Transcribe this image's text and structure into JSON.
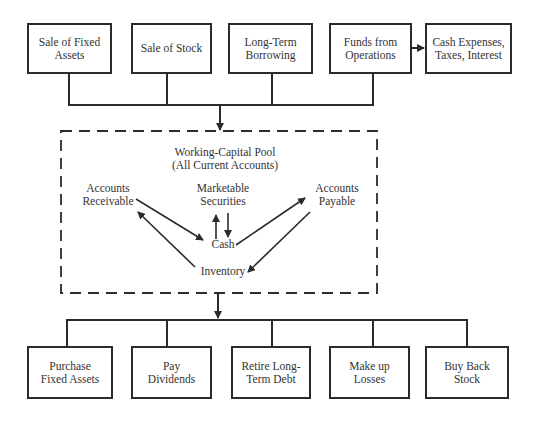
{
  "diagram": {
    "sources": [
      {
        "id": "sale-fixed-assets",
        "label": "Sale of Fixed\nAssets"
      },
      {
        "id": "sale-stock",
        "label": "Sale of Stock"
      },
      {
        "id": "long-term-borrowing",
        "label": "Long-Term\nBorrowing"
      },
      {
        "id": "funds-from-operations",
        "label": "Funds from\nOperations"
      }
    ],
    "expense_box": {
      "id": "cash-expenses",
      "label": "Cash Expenses,\nTaxes, Interest"
    },
    "pool": {
      "title": "Working-Capital Pool\n(All Current Accounts)",
      "nodes": [
        {
          "id": "accounts-receivable",
          "label": "Accounts\nReceivable"
        },
        {
          "id": "marketable-securities",
          "label": "Marketable\nSecurities"
        },
        {
          "id": "accounts-payable",
          "label": "Accounts\nPayable"
        },
        {
          "id": "cash",
          "label": "Cash"
        },
        {
          "id": "inventory",
          "label": "Inventory"
        }
      ],
      "flows": [
        {
          "from": "accounts-receivable",
          "to": "cash"
        },
        {
          "from": "inventory",
          "to": "accounts-receivable"
        },
        {
          "from": "cash",
          "to": "marketable-securities"
        },
        {
          "from": "marketable-securities",
          "to": "cash"
        },
        {
          "from": "cash",
          "to": "accounts-payable"
        },
        {
          "from": "accounts-payable",
          "to": "inventory"
        }
      ]
    },
    "uses": [
      {
        "id": "purchase-fixed-assets",
        "label": "Purchase\nFixed Assets"
      },
      {
        "id": "pay-dividends",
        "label": "Pay\nDividends"
      },
      {
        "id": "retire-long-term-debt",
        "label": "Retire Long-\nTerm Debt"
      },
      {
        "id": "make-up-losses",
        "label": "Make up\nLosses"
      },
      {
        "id": "buy-back-stock",
        "label": "Buy Back\nStock"
      }
    ],
    "colors": {
      "line": "#2b2b2b",
      "text": "#333333",
      "background": "#ffffff"
    }
  }
}
